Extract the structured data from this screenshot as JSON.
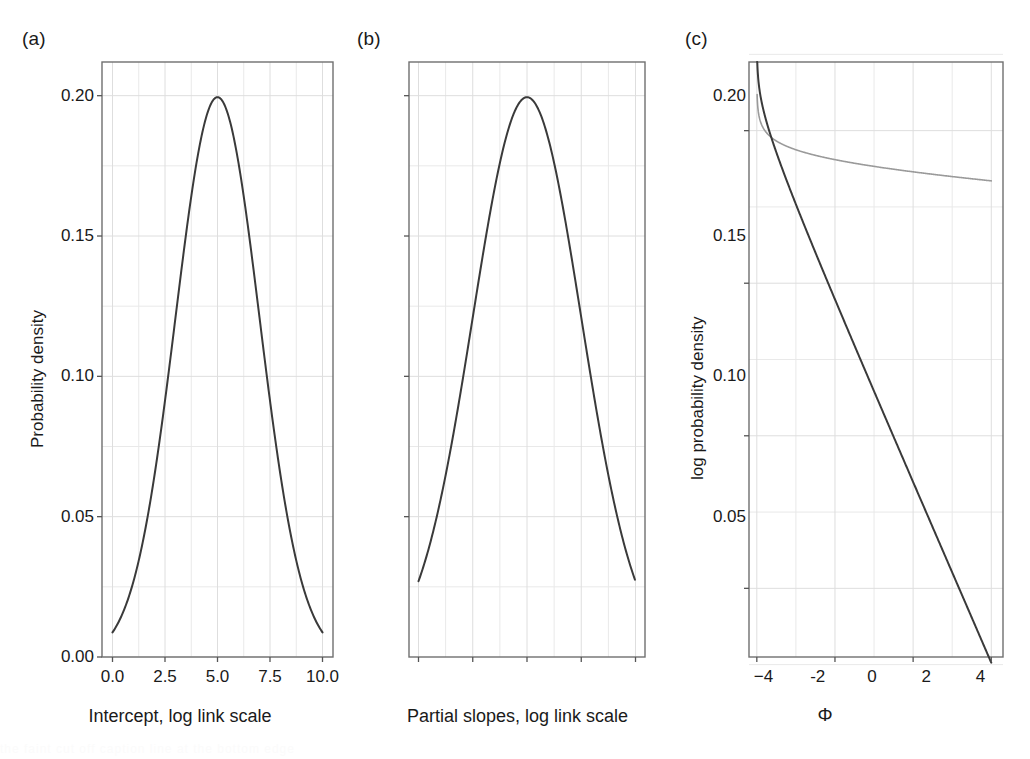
{
  "figure": {
    "background": "#ffffff",
    "panel_frame_color": "#6f6f6f",
    "grid_color": "#e9e9e9",
    "curve_color_dark": "#3a3a3a",
    "curve_color_light": "#9a9a9a",
    "tick_color": "#555555",
    "caption_partial": "the faint cut off caption line at the bottom edge"
  },
  "panels": [
    {
      "tag": "(a)",
      "xlabel": "Intercept, log link scale",
      "ylabel": "Probability density",
      "xticks": [
        "0.0",
        "2.5",
        "5.0",
        "7.5",
        "10.0"
      ],
      "yticks": [
        "0.00",
        "0.05",
        "0.10",
        "0.15",
        "0.20"
      ]
    },
    {
      "tag": "(b)",
      "xlabel": "Partial slopes, log link scale",
      "ylabel": "",
      "xticks": [
        "−4",
        "-2",
        "0",
        "2",
        "4"
      ],
      "yticks": [
        "0.05",
        "0.10",
        "0.15",
        "0.20"
      ]
    },
    {
      "tag": "(c)",
      "xlabel": "Φ",
      "ylabel": "log probability density",
      "xticks": [
        "0",
        "1",
        "2",
        "3"
      ],
      "yticks": [
        "−30",
        "−20",
        "−10",
        "0"
      ]
    }
  ],
  "chart_data": [
    {
      "type": "line",
      "panel": "(a)",
      "title": "",
      "xlabel": "Intercept, log link scale",
      "ylabel": "Probability density",
      "xlim": [
        -0.5,
        10.5
      ],
      "ylim": [
        0.0,
        0.212
      ],
      "xticks": [
        0.0,
        2.5,
        5.0,
        7.5,
        10.0
      ],
      "yticks": [
        0.0,
        0.05,
        0.1,
        0.15,
        0.2
      ],
      "grid": true,
      "legend": "none",
      "series": [
        {
          "name": "Normal(mean 5, sd 2) prior density",
          "distribution": "normal",
          "mean": 5,
          "sd": 2,
          "peak_x": 5.0,
          "peak_y": 0.1995,
          "x": [
            0.0,
            0.5,
            1.0,
            1.5,
            2.0,
            2.5,
            3.0,
            3.5,
            4.0,
            4.5,
            5.0,
            5.5,
            6.0,
            6.5,
            7.0,
            7.5,
            8.0,
            8.5,
            9.0,
            9.5,
            10.0
          ],
          "values": [
            0.0088,
            0.0175,
            0.0324,
            0.0558,
            0.0899,
            0.135,
            0.1895,
            0.2468,
            0.0,
            0.0,
            0.1995,
            0.0,
            0.0,
            0.0,
            0.0,
            0.0,
            0.0,
            0.0,
            0.0,
            0.0,
            0.0088
          ]
        }
      ]
    },
    {
      "type": "line",
      "panel": "(b)",
      "title": "",
      "xlabel": "Partial slopes, log link scale",
      "ylabel": "",
      "xlim": [
        -4.35,
        4.35
      ],
      "ylim": [
        0.0,
        0.212
      ],
      "xticks": [
        -4,
        -2,
        0,
        2,
        4
      ],
      "yticks": [
        0.05,
        0.1,
        0.15,
        0.2
      ],
      "grid": true,
      "legend": "none",
      "series": [
        {
          "name": "Normal(mean 0, sd 2) prior density",
          "distribution": "normal",
          "mean": 0,
          "sd": 2,
          "peak_x": 0.0,
          "peak_y": 0.1995,
          "x": [
            -4,
            -3,
            -2,
            -1,
            0,
            1,
            2,
            3,
            4
          ],
          "values": [
            0.027,
            0.0648,
            0.121,
            0.176,
            0.1995,
            0.176,
            0.121,
            0.0648,
            0.027
          ]
        }
      ]
    },
    {
      "type": "line",
      "panel": "(c)",
      "title": "",
      "xlabel": "Φ",
      "ylabel": "log probability density",
      "xlim": [
        -0.1,
        3.15
      ],
      "ylim": [
        -34.5,
        4.5
      ],
      "xticks": [
        0,
        1,
        2,
        3
      ],
      "yticks": [
        -30,
        -20,
        -10,
        0
      ],
      "grid": true,
      "legend": "none",
      "series": [
        {
          "name": "steep log density (dark)",
          "color": "#3a3a3a",
          "x": [
            0.01,
            0.02,
            0.04,
            0.07,
            0.12,
            0.2,
            0.3,
            0.45,
            0.6,
            0.8,
            1.0,
            1.25,
            1.5,
            1.75,
            2.0,
            2.25,
            2.5,
            2.75,
            3.0
          ],
          "values": [
            4.2,
            3.0,
            1.7,
            0.7,
            -0.3,
            -1.9,
            -3.4,
            -5.5,
            -7.5,
            -10.1,
            -12.6,
            -15.7,
            -18.7,
            -21.7,
            -24.6,
            -27.4,
            -30.0,
            -31.8,
            -33.4
          ]
        },
        {
          "name": "shallow log density (light grey)",
          "color": "#9a9a9a",
          "x": [
            0.05,
            0.1,
            0.2,
            0.3,
            0.45,
            0.6,
            0.8,
            1.0,
            1.25,
            1.5,
            1.75,
            2.0,
            2.25,
            2.5,
            2.75,
            3.0
          ],
          "values": [
            -0.35,
            -0.75,
            -1.3,
            -1.7,
            -2.1,
            -2.4,
            -2.7,
            -2.95,
            -3.2,
            -3.4,
            -3.6,
            -3.75,
            -3.9,
            -4.05,
            -4.15,
            -4.3
          ]
        }
      ]
    }
  ]
}
